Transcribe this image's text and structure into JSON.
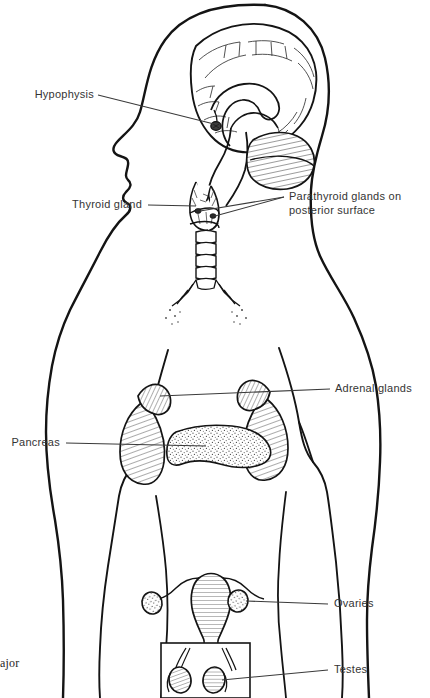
{
  "figure": {
    "stroke_color": "#1a1a1a",
    "leader_color": "#3a3a3a",
    "background": "#ffffff",
    "text_color": "#343434"
  },
  "labels": {
    "hypophysis": "Hypophysis",
    "thyroid": "Thyroid gland",
    "parathyroid": "Parathyroid glands on\nposterior surface",
    "adrenal": "Adrenal glands",
    "pancreas": "Pancreas",
    "ovaries": "Ovaries",
    "testes": "Testes"
  },
  "caption": {
    "fragment": "ajor"
  },
  "structures": [
    {
      "name": "brain-sagittal-section",
      "label": "Hypophysis"
    },
    {
      "name": "cerebellum",
      "label": ""
    },
    {
      "name": "pituitary-gland",
      "label": "Hypophysis"
    },
    {
      "name": "thyroid-gland",
      "label": "Thyroid gland"
    },
    {
      "name": "parathyroid-glands",
      "label": "Parathyroid glands on posterior surface"
    },
    {
      "name": "trachea",
      "label": ""
    },
    {
      "name": "bronchi",
      "label": ""
    },
    {
      "name": "kidneys",
      "label": ""
    },
    {
      "name": "adrenal-glands",
      "label": "Adrenal glands"
    },
    {
      "name": "pancreas",
      "label": "Pancreas"
    },
    {
      "name": "uterus",
      "label": ""
    },
    {
      "name": "ovaries",
      "label": "Ovaries"
    },
    {
      "name": "testes",
      "label": "Testes"
    }
  ]
}
